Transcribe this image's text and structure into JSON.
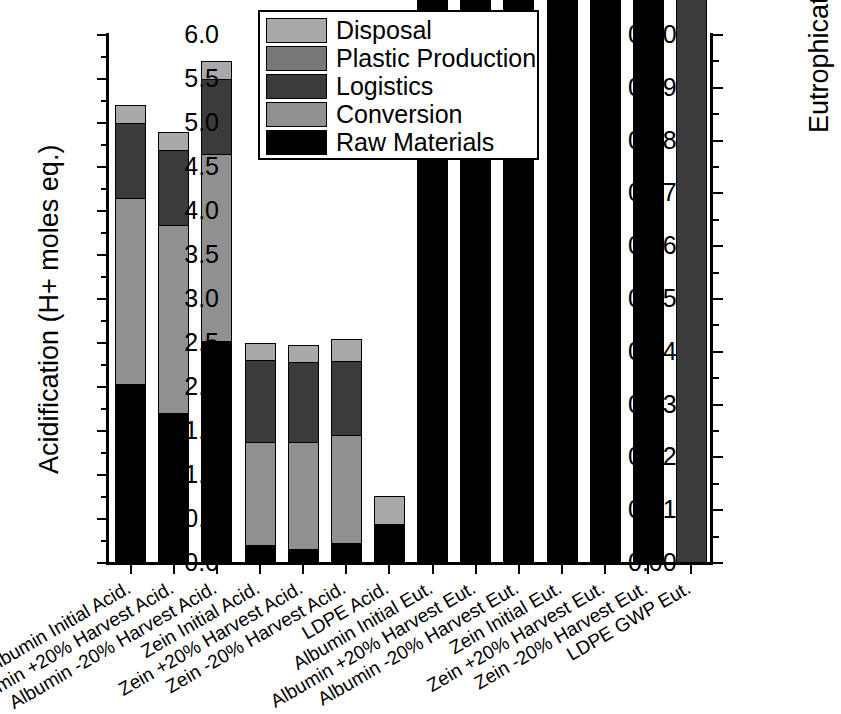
{
  "chart_data": {
    "type": "bar",
    "subtype": "stacked",
    "title": "",
    "xlabel": "",
    "ylabel": "Acidification (H+ moles eq.)",
    "y2label": "Eutrophication (kg N eq.)",
    "ylim": [
      0.0,
      6.0
    ],
    "y2lim": [
      0.0,
      0.1
    ],
    "ytick_labels": [
      "0.0",
      "0.5",
      "1.0",
      "1.5",
      "2.0",
      "2.5",
      "3.0",
      "3.5",
      "4.0",
      "4.5",
      "5.0",
      "5.5",
      "6.0"
    ],
    "ytick_values": [
      0.0,
      0.5,
      1.0,
      1.5,
      2.0,
      2.5,
      3.0,
      3.5,
      4.0,
      4.5,
      5.0,
      5.5,
      6.0
    ],
    "y2tick_labels": [
      "0.00",
      "0.01",
      "0.02",
      "0.03",
      "0.04",
      "0.05",
      "0.06",
      "0.07",
      "0.08",
      "0.09",
      "0.10"
    ],
    "y2tick_values": [
      0.0,
      0.01,
      0.02,
      0.03,
      0.04,
      0.05,
      0.06,
      0.07,
      0.08,
      0.09,
      0.1
    ],
    "grid": false,
    "legend_position": "top-center",
    "legend": [
      "Disposal",
      "Plastic Production",
      "Logistics",
      "Conversion",
      "Raw Materials"
    ],
    "colors": {
      "Disposal": "#a9a9a9",
      "Plastic Production": "#777777",
      "Logistics": "#3b3b3b",
      "Conversion": "#909090",
      "Raw Materials": "#000000"
    },
    "categories": [
      "Albumin Initial Acid.",
      "Albumin +20% Harvest Acid.",
      "Albumin -20% Harvest Acid.",
      "Zein Initial Acid.",
      "Zein +20% Harvest Acid.",
      "Zein -20% Harvest Acid.",
      "LDPE Acid.",
      "Albumin Initial Eut.",
      "Albumin +20% Harvest Eut.",
      "Albumin -20% Harvest Eut.",
      "Zein Initial Eut.",
      "Zein +20% Harvest Eut.",
      "Zein -20% Harvest Eut.",
      "LDPE GWP Eut."
    ],
    "category_axis": [
      "left",
      "left",
      "left",
      "left",
      "left",
      "left",
      "left",
      "right",
      "right",
      "right",
      "right",
      "right",
      "right",
      "right"
    ],
    "series": [
      {
        "name": "Raw Materials",
        "values": [
          2.03,
          1.71,
          2.52,
          0.2,
          0.16,
          0.23,
          0.44,
          1.41,
          1.2,
          1.78,
          0.49,
          0.41,
          0.6,
          0.0
        ]
      },
      {
        "name": "Conversion",
        "values": [
          2.12,
          2.13,
          2.13,
          1.18,
          1.22,
          1.22,
          0.0,
          1.85,
          1.75,
          1.85,
          3.18,
          3.25,
          3.19,
          0.0
        ]
      },
      {
        "name": "Logistics",
        "values": [
          0.85,
          0.85,
          0.85,
          0.93,
          0.9,
          0.85,
          0.0,
          0.22,
          0.26,
          0.25,
          0.41,
          0.41,
          0.41,
          0.25
        ]
      },
      {
        "name": "Plastic Production",
        "values": [
          0.0,
          0.0,
          0.0,
          0.0,
          0.0,
          0.0,
          0.0,
          0.0,
          0.0,
          0.0,
          0.0,
          0.0,
          0.0,
          0.55
        ]
      },
      {
        "name": "Disposal",
        "values": [
          0.2,
          0.21,
          0.2,
          0.19,
          0.2,
          0.25,
          0.32,
          0.13,
          0.18,
          0.07,
          0.3,
          0.22,
          0.31,
          0.7
        ]
      }
    ],
    "totals": [
      5.2,
      4.9,
      5.7,
      2.5,
      2.48,
      2.55,
      0.76,
      3.61,
      3.39,
      3.95,
      4.38,
      4.29,
      4.51,
      1.5
    ]
  }
}
